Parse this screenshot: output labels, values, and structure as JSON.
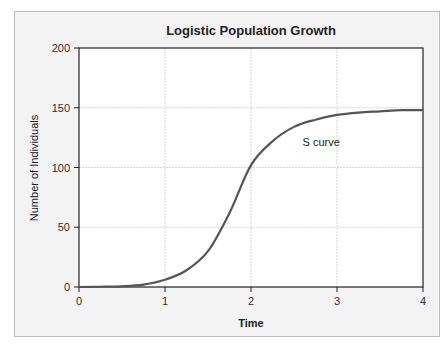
{
  "chart_data": {
    "type": "line",
    "title": "Logistic Population Growth",
    "xlabel": "Time",
    "ylabel": "Number of Individuals",
    "xlim": [
      0,
      4
    ],
    "ylim": [
      0,
      200
    ],
    "x_ticks": [
      "0",
      "1",
      "2",
      "3",
      "4"
    ],
    "y_ticks": [
      "0",
      "50",
      "100",
      "150",
      "200"
    ],
    "grid": true,
    "legend": null,
    "series": [
      {
        "name": "S curve",
        "color": "#555555",
        "x": [
          0,
          0.25,
          0.5,
          0.75,
          1.0,
          1.25,
          1.5,
          1.75,
          2.0,
          2.25,
          2.5,
          2.75,
          3.0,
          3.25,
          3.5,
          3.75,
          4.0
        ],
        "y": [
          0,
          0.2,
          0.6,
          2,
          6,
          14,
          30,
          62,
          102,
          122,
          134,
          140,
          144,
          146,
          147,
          148,
          148
        ]
      }
    ],
    "annotations": [
      {
        "text": "S curve",
        "x": 2.6,
        "y": 118
      }
    ]
  }
}
